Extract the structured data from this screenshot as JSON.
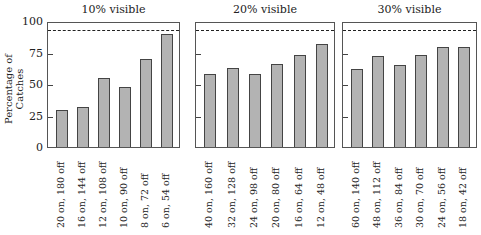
{
  "chart_data": {
    "type": "bar",
    "ylabel": "Percentage of Catches",
    "ylim": [
      0,
      100
    ],
    "yticks": [
      "0",
      "25",
      "50",
      "75",
      "100"
    ],
    "reference_line": {
      "style": "dashed",
      "value": 94
    },
    "panels": [
      {
        "title": "10% visible",
        "categories": [
          "20 on, 180 off",
          "16 on, 144 off",
          "12 on, 108 off",
          "10 on, 90 off",
          "8 on, 72 off",
          "6 on, 54 off"
        ],
        "values": [
          29,
          32,
          55,
          48,
          70,
          90
        ]
      },
      {
        "title": "20% visible",
        "categories": [
          "40 on, 160 off",
          "32 on, 128 off",
          "24 on, 98 off",
          "20 on, 80 off",
          "16 on, 64 off",
          "12 on, 48 off"
        ],
        "values": [
          58,
          63,
          58,
          66,
          73,
          82
        ]
      },
      {
        "title": "30% visible",
        "categories": [
          "60 on, 140 off",
          "48 on, 112 off",
          "36 on, 84 off",
          "30 on, 70 off",
          "24 on, 56 off",
          "18 on, 42 off"
        ],
        "values": [
          62,
          72,
          65,
          73,
          79,
          79
        ]
      }
    ]
  },
  "colors": {
    "bar_fill": "#b3b3b3",
    "bar_edge": "#444444",
    "axis": "#555555"
  }
}
